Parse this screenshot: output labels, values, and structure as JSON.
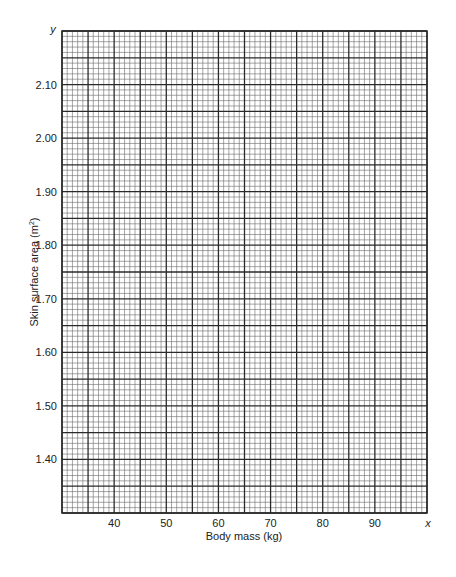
{
  "chart_data": {
    "type": "scatter",
    "title": "",
    "xlabel": "Body mass (kg)",
    "ylabel": "Skin surface area (m²)",
    "ylabel_main": "Skin surface area (m",
    "ylabel_sup": "2",
    "ylabel_tail": ")",
    "x_axis_symbol": "x",
    "y_axis_symbol": "y",
    "xlim": [
      30,
      100
    ],
    "ylim": [
      1.3,
      2.2
    ],
    "x_ticks": [
      40,
      50,
      60,
      70,
      80,
      90
    ],
    "x_tick_labels": [
      "40",
      "50",
      "60",
      "70",
      "80",
      "90"
    ],
    "y_ticks": [
      1.4,
      1.5,
      1.6,
      1.7,
      1.8,
      1.9,
      2.0,
      2.1
    ],
    "y_tick_labels": [
      "1.40",
      "1.50",
      "1.60",
      "1.70",
      "1.80",
      "1.90",
      "2.00",
      "2.10"
    ],
    "grid": {
      "on": true,
      "style": "graph paper",
      "x_major_step": 5,
      "x_minor_per_major": 5,
      "y_major_step": 0.05,
      "y_minor_per_major": 5
    },
    "series": [],
    "legend": null
  },
  "colors": {
    "background": "#ffffff",
    "major_line": "#2a2a2a",
    "minor_line": "#6a6a6a",
    "text": "#222222"
  }
}
